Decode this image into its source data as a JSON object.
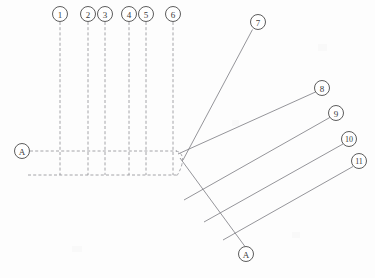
{
  "diagram": {
    "caption": "",
    "background_color": "#fdfdfd",
    "line_color": "#8d8d93",
    "balloon_stroke_color": "#4a4a4a",
    "label_color": "#3a3a3a",
    "width": 375,
    "height": 278,
    "balloons": [
      {
        "id": "balloon-1",
        "label": "1",
        "cx": 60,
        "cy": 14,
        "r": 7.5
      },
      {
        "id": "balloon-2",
        "label": "2",
        "cx": 88,
        "cy": 14,
        "r": 7.5
      },
      {
        "id": "balloon-3",
        "label": "3",
        "cx": 105,
        "cy": 14,
        "r": 7.5
      },
      {
        "id": "balloon-4",
        "label": "4",
        "cx": 129,
        "cy": 14,
        "r": 7.5
      },
      {
        "id": "balloon-5",
        "label": "5",
        "cx": 146,
        "cy": 14,
        "r": 7.5
      },
      {
        "id": "balloon-6",
        "label": "6",
        "cx": 173,
        "cy": 14,
        "r": 7.5
      },
      {
        "id": "balloon-7",
        "label": "7",
        "cx": 258,
        "cy": 22,
        "r": 7.5
      },
      {
        "id": "balloon-8",
        "label": "8",
        "cx": 322,
        "cy": 88,
        "r": 7.5
      },
      {
        "id": "balloon-9",
        "label": "9",
        "cx": 336,
        "cy": 113,
        "r": 7.5
      },
      {
        "id": "balloon-10",
        "label": "10",
        "cx": 349,
        "cy": 139,
        "r": 7.5
      },
      {
        "id": "balloon-11",
        "label": "11",
        "cx": 359,
        "cy": 161,
        "r": 7.5
      },
      {
        "id": "section-marker-a-left",
        "label": "A",
        "cx": 22,
        "cy": 151,
        "r": 7.5
      },
      {
        "id": "section-marker-a-bottom",
        "label": "A",
        "cx": 246,
        "cy": 254,
        "r": 7.5
      }
    ],
    "vertical_leaders": [
      {
        "id": "leader-1",
        "x": 60,
        "y1": 22,
        "y2": 175
      },
      {
        "id": "leader-2",
        "x": 88,
        "y1": 22,
        "y2": 175
      },
      {
        "id": "leader-3",
        "x": 105,
        "y1": 22,
        "y2": 175
      },
      {
        "id": "leader-4",
        "x": 129,
        "y1": 22,
        "y2": 175
      },
      {
        "id": "leader-5",
        "x": 146,
        "y1": 22,
        "y2": 175
      },
      {
        "id": "leader-6",
        "x": 173,
        "y1": 22,
        "y2": 175
      }
    ],
    "horizontal_runs": [
      {
        "id": "harness-upper-run",
        "x1": 30,
        "y1": 151,
        "x2": 176,
        "y2": 151
      },
      {
        "id": "harness-lower-run",
        "x1": 28,
        "y1": 175,
        "x2": 176,
        "y2": 175
      }
    ],
    "corner_curve": {
      "id": "harness-corner-curve",
      "path": "M 176 151 Q 184 152 180 165 Q 178 171 176 175"
    },
    "diagonal_leaders": [
      {
        "id": "leader-7",
        "x1": 184,
        "y1": 160,
        "x2": 252,
        "y2": 29
      },
      {
        "id": "leader-8",
        "x1": 179,
        "y1": 153,
        "x2": 315,
        "y2": 92
      },
      {
        "id": "leader-9",
        "x1": 184,
        "y1": 200,
        "x2": 330,
        "y2": 117
      },
      {
        "id": "leader-10",
        "x1": 204,
        "y1": 222,
        "x2": 343,
        "y2": 144
      },
      {
        "id": "leader-11",
        "x1": 223,
        "y1": 240,
        "x2": 353,
        "y2": 166
      }
    ],
    "section_cut_line": {
      "id": "section-cut-a-a",
      "x1": 180,
      "y1": 160,
      "x2": 245,
      "y2": 246
    }
  }
}
